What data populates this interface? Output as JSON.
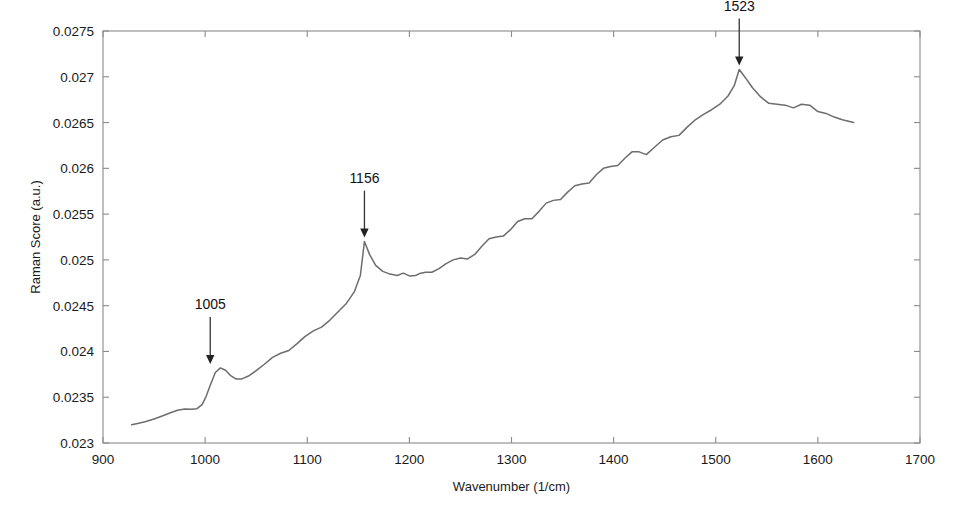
{
  "chart_data": {
    "type": "line",
    "title": "",
    "xlabel": "Wavenumber (1/cm)",
    "ylabel": "Raman Score (a.u.)",
    "xlim": [
      900,
      1700
    ],
    "ylim": [
      0.023,
      0.0275
    ],
    "xticks": [
      900,
      1000,
      1100,
      1200,
      1300,
      1400,
      1500,
      1600,
      1700
    ],
    "xtick_labels": [
      "900",
      "1000",
      "1100",
      "1200",
      "1300",
      "1400",
      "1500",
      "1600",
      "1700"
    ],
    "yticks": [
      0.023,
      0.0235,
      0.024,
      0.0245,
      0.025,
      0.0255,
      0.026,
      0.0265,
      0.027,
      0.0275
    ],
    "ytick_labels": [
      "0.023",
      "0.0235",
      "0.024",
      "0.0245",
      "0.025",
      "0.0255",
      "0.026",
      "0.0265",
      "0.027",
      "0.0275"
    ],
    "grid": false,
    "legend": false,
    "line_color": "#6d6d6d",
    "axis_color": "#8a8a8a",
    "series": [
      {
        "name": "Raman score spectrum",
        "x": [
          928,
          935,
          942,
          950,
          958,
          966,
          973,
          980,
          986,
          992,
          997,
          1001,
          1005,
          1010,
          1015,
          1020,
          1025,
          1030,
          1036,
          1043,
          1050,
          1058,
          1066,
          1074,
          1082,
          1090,
          1098,
          1106,
          1114,
          1122,
          1130,
          1138,
          1146,
          1152,
          1156,
          1161,
          1167,
          1174,
          1181,
          1188,
          1194,
          1200,
          1206,
          1211,
          1216,
          1222,
          1229,
          1236,
          1243,
          1250,
          1257,
          1264,
          1271,
          1278,
          1285,
          1292,
          1299,
          1306,
          1313,
          1320,
          1327,
          1334,
          1341,
          1348,
          1355,
          1362,
          1369,
          1376,
          1383,
          1390,
          1397,
          1404,
          1411,
          1418,
          1425,
          1432,
          1440,
          1448,
          1456,
          1464,
          1472,
          1480,
          1488,
          1496,
          1504,
          1512,
          1518,
          1523,
          1529,
          1536,
          1544,
          1552,
          1560,
          1568,
          1576,
          1584,
          1592,
          1600,
          1608,
          1616,
          1624,
          1635
        ],
        "y": [
          0.0232,
          0.023215,
          0.023235,
          0.023262,
          0.023295,
          0.02333,
          0.023358,
          0.023372,
          0.023368,
          0.023375,
          0.02342,
          0.02351,
          0.02363,
          0.02377,
          0.02382,
          0.023795,
          0.023735,
          0.0237,
          0.0237,
          0.023735,
          0.02379,
          0.02386,
          0.023935,
          0.02398,
          0.02401,
          0.024085,
          0.024165,
          0.024225,
          0.024265,
          0.02434,
          0.02443,
          0.02452,
          0.02465,
          0.02483,
          0.0252,
          0.02506,
          0.02494,
          0.024875,
          0.024845,
          0.02483,
          0.024855,
          0.024825,
          0.02483,
          0.024855,
          0.024865,
          0.024865,
          0.024905,
          0.02496,
          0.025,
          0.02502,
          0.02501,
          0.02506,
          0.02515,
          0.02523,
          0.02525,
          0.02526,
          0.02533,
          0.02542,
          0.02545,
          0.02545,
          0.02553,
          0.02562,
          0.02565,
          0.02566,
          0.02574,
          0.02581,
          0.02583,
          0.02584,
          0.02593,
          0.026,
          0.02602,
          0.02603,
          0.02611,
          0.02618,
          0.02618,
          0.02615,
          0.02623,
          0.02631,
          0.026345,
          0.02636,
          0.02645,
          0.02653,
          0.02659,
          0.02664,
          0.0267,
          0.02679,
          0.0269,
          0.02708,
          0.02699,
          0.02688,
          0.02678,
          0.02671,
          0.0267,
          0.02669,
          0.02666,
          0.0267,
          0.02669,
          0.02662,
          0.0266,
          0.02656,
          0.02653,
          0.0265
        ]
      }
    ],
    "annotations": [
      {
        "label": "1005",
        "x": 1005,
        "y": 0.02382,
        "label_y": 0.02442,
        "arrow": "down"
      },
      {
        "label": "1156",
        "x": 1156,
        "y": 0.0252,
        "label_y": 0.0258,
        "arrow": "down"
      },
      {
        "label": "1523",
        "x": 1523,
        "y": 0.02708,
        "label_y": 0.02768,
        "arrow": "down"
      }
    ]
  }
}
